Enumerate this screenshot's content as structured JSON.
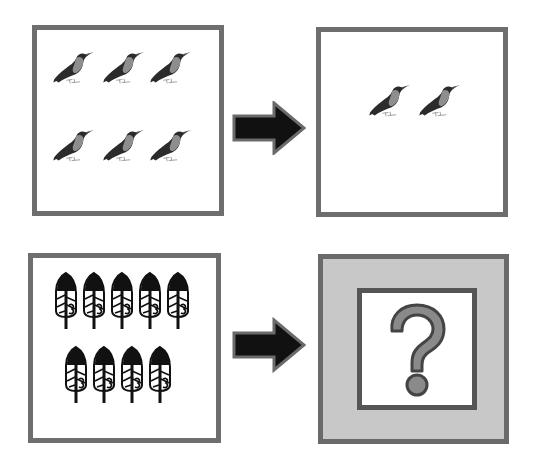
{
  "puzzle": {
    "rows": [
      {
        "left": {
          "item": "bird-icon",
          "count": 6,
          "arrangement": [
            3,
            3
          ]
        },
        "arrow": "right-arrow-icon",
        "right": {
          "item": "bird-icon",
          "count": 2,
          "arrangement": [
            2
          ]
        }
      },
      {
        "left": {
          "item": "feather-icon",
          "count": 9,
          "arrangement": [
            5,
            4
          ]
        },
        "arrow": "right-arrow-icon",
        "right": {
          "item": "question-mark-icon",
          "unknown": true,
          "symbol": "?"
        }
      }
    ]
  },
  "colors": {
    "frame": "#6e6e6e",
    "unknown_fill": "#c8c8c8",
    "arrow": "#111111",
    "question_fill": "#8a8a8a",
    "question_stroke": "#444444"
  }
}
